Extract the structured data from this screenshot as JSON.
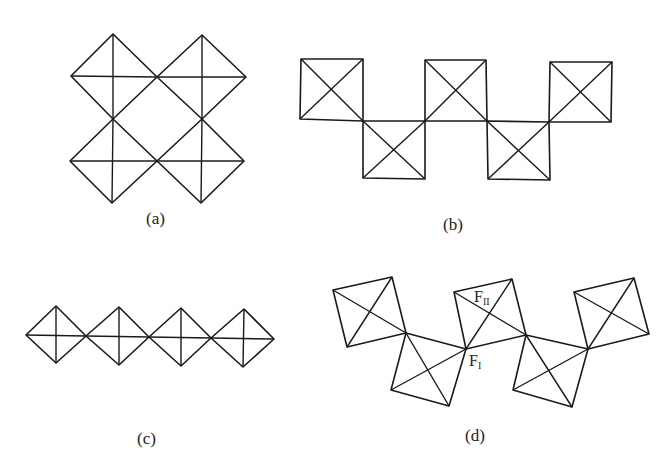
{
  "panels": [
    {
      "id": "a",
      "caption": "(a)",
      "description": "Four diamond-oriented squares (octahedra projections) sharing corners in a 2x2 ring"
    },
    {
      "id": "b",
      "caption": "(b)",
      "description": "Five squares with crossed diagonals sharing corners in a zig-zag chain"
    },
    {
      "id": "c",
      "caption": "(c)",
      "description": "Four diamonds with horizontal and vertical axes sharing corners in a straight chain"
    },
    {
      "id": "d",
      "caption": "(d)",
      "description": "Five tilted squares with crossed diagonals sharing corners in a kinked zig-zag chain"
    }
  ],
  "annotations": {
    "f_two": {
      "base": "F",
      "sub": "II"
    },
    "f_one": {
      "base": "F",
      "sub": "I"
    }
  },
  "colors": {
    "line": "#1a1a1a",
    "background": "#ffffff"
  }
}
